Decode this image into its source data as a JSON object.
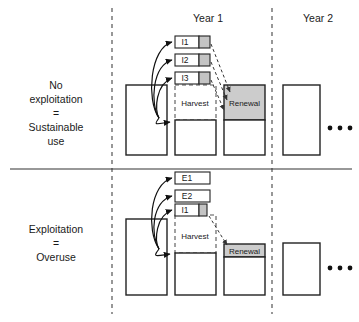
{
  "figure": {
    "accent_gray": "#c4c4c4",
    "renewal_gray": "#cccccc",
    "stroke_color": "#222222"
  },
  "columns": {
    "year1_label": "Year 1",
    "year2_label": "Year 2",
    "continuation": "• • •"
  },
  "rows": [
    {
      "id": "sustainable",
      "label_lines": [
        "No",
        "exploitation",
        "=",
        "Sustainable",
        "use"
      ],
      "flow_boxes": [
        {
          "label": "I1",
          "has_gray": true
        },
        {
          "label": "I2",
          "has_gray": true
        },
        {
          "label": "I3",
          "has_gray": true
        }
      ],
      "harvest_label": "Harvest",
      "renewal_label": "Renewal",
      "dots": "• • •"
    },
    {
      "id": "overuse",
      "label_lines": [
        "Exploitation",
        "=",
        "Overuse"
      ],
      "flow_boxes": [
        {
          "label": "E1",
          "has_gray": false
        },
        {
          "label": "E2",
          "has_gray": false
        },
        {
          "label": "I1",
          "has_gray": true
        }
      ],
      "harvest_label": "Harvest",
      "renewal_label": "Renewal",
      "dots": "• • •"
    }
  ]
}
